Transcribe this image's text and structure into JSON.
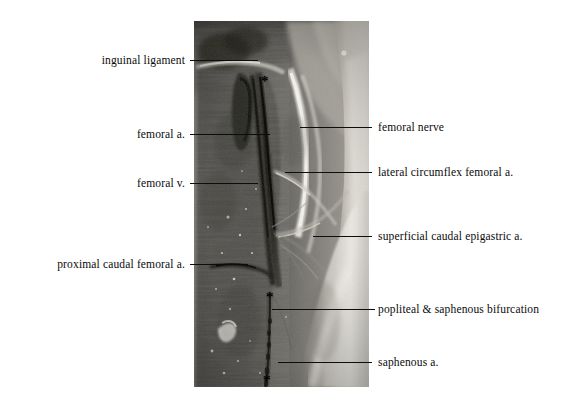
{
  "figure": {
    "background_color": "#ffffff",
    "width": 583,
    "height": 408,
    "kind": "anatomical-dissection-photograph"
  },
  "photo": {
    "left": 194,
    "top": 21,
    "width": 175,
    "height": 366,
    "palette": {
      "muscle_dark": "#4a4a48",
      "muscle_mid": "#6e6c68",
      "muscle_light": "#8d8a85",
      "fascia_white": "#dedbd4",
      "fascia_bright": "#f0eee9",
      "vessel_black": "#14140f",
      "vessel_dark": "#2b2a26",
      "skin_pale": "#b9b5ad",
      "shadow": "#2f2e2b"
    }
  },
  "labels": [
    {
      "id": "inguinal-ligament",
      "text": "inguinal ligament",
      "side": "left",
      "text_right": 185,
      "text_baseline_y": 63,
      "leader": {
        "x1": 190,
        "x2": 258,
        "y": 60
      }
    },
    {
      "id": "femoral-artery",
      "text": "femoral a.",
      "side": "left",
      "text_right": 185,
      "text_baseline_y": 137,
      "leader": {
        "x1": 190,
        "x2": 270,
        "y": 134
      }
    },
    {
      "id": "femoral-vein",
      "text": "femoral v.",
      "side": "left",
      "text_right": 185,
      "text_baseline_y": 186,
      "leader": {
        "x1": 190,
        "x2": 258,
        "y": 183
      }
    },
    {
      "id": "proximal-caudal-femoral-artery",
      "text": "proximal caudal femoral a.",
      "side": "left",
      "text_right": 185,
      "text_baseline_y": 267,
      "leader": {
        "x1": 190,
        "x2": 248,
        "y": 264
      }
    },
    {
      "id": "femoral-nerve",
      "text": "femoral nerve",
      "side": "right",
      "text_left": 378,
      "text_baseline_y": 130,
      "leader": {
        "x1": 300,
        "x2": 372,
        "y": 127
      }
    },
    {
      "id": "lateral-circumflex-femoral-artery",
      "text": "lateral circumflex femoral a.",
      "side": "right",
      "text_left": 378,
      "text_baseline_y": 175,
      "leader": {
        "x1": 285,
        "x2": 372,
        "y": 172
      }
    },
    {
      "id": "superficial-caudal-epigastric-artery",
      "text": "superficial caudal epigastric a.",
      "side": "right",
      "text_left": 378,
      "text_baseline_y": 240,
      "leader": {
        "x1": 313,
        "x2": 372,
        "y": 236
      }
    },
    {
      "id": "popliteal-and-saphenous-bifurcation",
      "text": "popliteal & saphenous bifurcation",
      "side": "right",
      "text_left": 378,
      "text_baseline_y": 312,
      "leader": {
        "x1": 272,
        "x2": 375,
        "y": 309
      }
    },
    {
      "id": "saphenous-artery",
      "text": "saphenous a.",
      "side": "right",
      "text_left": 378,
      "text_baseline_y": 365,
      "leader": {
        "x1": 278,
        "x2": 372,
        "y": 362
      }
    }
  ],
  "markers": [
    {
      "id": "asterisk-proximal",
      "glyph": "*",
      "x": 261,
      "y": 74
    },
    {
      "id": "asterisk-bifurcation",
      "glyph": "*",
      "x": 266,
      "y": 290
    },
    {
      "id": "asterisk-distal",
      "glyph": "*",
      "x": 263,
      "y": 373
    }
  ]
}
